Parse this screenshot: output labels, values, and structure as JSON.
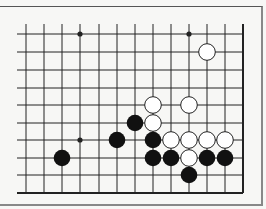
{
  "diagram": {
    "type": "go-board-fragment",
    "colors": {
      "background": "#f7f7f5",
      "line": "#222222",
      "black_stone": "#111111",
      "white_stone": "#ffffff",
      "white_stone_edge": "#222222"
    },
    "grid": {
      "columns_x": [
        26,
        44,
        62,
        80,
        99,
        117,
        135,
        153,
        171,
        189,
        207,
        225,
        243
      ],
      "rows_y": [
        34,
        52,
        70,
        88,
        105,
        123,
        140,
        158,
        175,
        193
      ],
      "open_left_x": 17,
      "open_top_y": 24,
      "right_edge": true,
      "bottom_edge": true
    },
    "star_points": [
      {
        "row": 0,
        "col": 3
      },
      {
        "row": 0,
        "col": 9
      },
      {
        "row": 6,
        "col": 3
      }
    ],
    "stones": [
      {
        "color": "white",
        "row": 1,
        "col": 10
      },
      {
        "color": "white",
        "row": 4,
        "col": 7
      },
      {
        "color": "white",
        "row": 4,
        "col": 9
      },
      {
        "color": "black",
        "row": 5,
        "col": 6
      },
      {
        "color": "white",
        "row": 5,
        "col": 7
      },
      {
        "color": "black",
        "row": 6,
        "col": 5
      },
      {
        "color": "black",
        "row": 6,
        "col": 7
      },
      {
        "color": "white",
        "row": 6,
        "col": 8
      },
      {
        "color": "white",
        "row": 6,
        "col": 9
      },
      {
        "color": "white",
        "row": 6,
        "col": 10
      },
      {
        "color": "white",
        "row": 6,
        "col": 11
      },
      {
        "color": "black",
        "row": 7,
        "col": 2
      },
      {
        "color": "black",
        "row": 7,
        "col": 7
      },
      {
        "color": "black",
        "row": 7,
        "col": 8
      },
      {
        "color": "white",
        "row": 7,
        "col": 9
      },
      {
        "color": "black",
        "row": 7,
        "col": 10
      },
      {
        "color": "black",
        "row": 7,
        "col": 11
      },
      {
        "color": "black",
        "row": 8,
        "col": 9
      }
    ]
  }
}
